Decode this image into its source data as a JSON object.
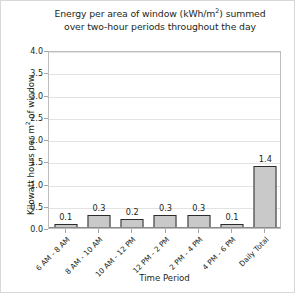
{
  "chart_data": {
    "type": "bar",
    "title_line1_pre": "Energy per area of window (kWh/m",
    "title_line1_sup": "2",
    "title_line1_post": ") summed",
    "title_line2": "over two-hour periods throughout the day",
    "xlabel": "Time Period",
    "ylabel": "Kilowatt hours per m² of window",
    "ylabel_pre": "Kilowatt hours per m",
    "ylabel_sup": "2",
    "ylabel_post": " of window",
    "categories": [
      "6 AM - 8 AM",
      "8 AM - 10 AM",
      "10 AM - 12 PM",
      "12 PM - 2 PM",
      "2 PM - 4 PM",
      "4 PM - 6 PM",
      "Daily Total"
    ],
    "values": [
      0.1,
      0.3,
      0.2,
      0.3,
      0.3,
      0.1,
      1.4
    ],
    "value_labels": [
      "0.1",
      "0.3",
      "0.2",
      "0.3",
      "0.3",
      "0.1",
      "1.4"
    ],
    "ylim": [
      0.0,
      4.0
    ],
    "ytick_values": [
      0.0,
      0.5,
      1.0,
      1.5,
      2.0,
      2.5,
      3.0,
      3.5,
      4.0
    ],
    "ytick_labels": [
      "0.0",
      "0.5",
      "1.0",
      "1.5",
      "2.0",
      "2.5",
      "3.0",
      "3.5",
      "4.0"
    ],
    "grid": true,
    "grid_axis": "y",
    "legend": false,
    "bar_fill_color": "#c9c9c9",
    "bar_edge_color": "#2b2b2b",
    "text_color": "#231f20",
    "gridline_color": "#e3e3e3",
    "plot_border_color": "#bdbdbd",
    "background_color": "#ffffff"
  }
}
